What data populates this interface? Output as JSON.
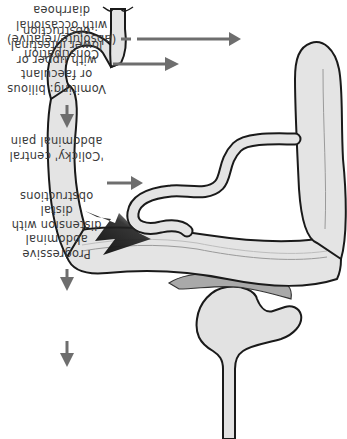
{
  "figure": {
    "orientation": "rotated-180",
    "colors": {
      "organ_fill": "#e4e4e4",
      "organ_stroke": "#1a1a1a",
      "pancreas_fill": "#a8a8a8",
      "arrow": "#6e6e6e",
      "pain_bolt": "#222222",
      "text": "#3a3a3a"
    },
    "labels": [
      {
        "id": "vomiting",
        "lines": [
          "Vomiting: bilious",
          "or faeculant",
          "with upper or",
          "lower intestinal",
          "obstruction"
        ]
      },
      {
        "id": "colicky-pain",
        "lines": [
          "'Colicky' central",
          "abdominal pain"
        ]
      },
      {
        "id": "distension",
        "lines": [
          "Progressive",
          "abdominal",
          "distension with",
          "distal",
          "obstructions"
        ]
      },
      {
        "id": "constipation",
        "lines": [
          "Constipation",
          "(absolute/relative)",
          "with occasional",
          "diarrhoea"
        ]
      }
    ],
    "flow": [
      "Vomiting",
      "Colicky central abdominal pain",
      "Progressive abdominal distension",
      "Constipation"
    ],
    "icons": [
      "flow-arrow-down-icon",
      "pointer-arrow-icon",
      "pain-bolt-icon"
    ]
  }
}
